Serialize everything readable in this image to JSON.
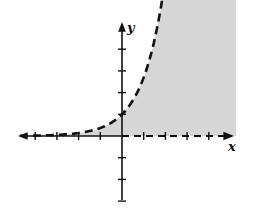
{
  "chart_data": {
    "type": "line",
    "title": "",
    "xlabel": "x",
    "ylabel": "y",
    "xlim": [
      -5,
      5
    ],
    "ylim": [
      -3,
      5.3
    ],
    "tick_spacing": 1,
    "x_ticks": [
      -4,
      -3,
      -2,
      -1,
      1,
      2,
      3,
      4
    ],
    "y_ticks": [
      -3,
      -2,
      -1,
      1,
      2,
      3,
      4
    ],
    "grid": false,
    "legend": null,
    "series": [
      {
        "name": "boundary curve",
        "style": "dashed",
        "x": [
          -5,
          -4,
          -3,
          -2,
          -1,
          0,
          0.5,
          1,
          1.5,
          1.95
        ],
        "y": [
          0.01,
          0.02,
          0.05,
          0.14,
          0.37,
          1,
          1.65,
          2.7,
          4.4,
          5.3
        ]
      },
      {
        "name": "boundary line y=0",
        "style": "dashed",
        "x": [
          0,
          5
        ],
        "y": [
          0,
          0
        ]
      }
    ],
    "shaded_region": {
      "description": "region below the dashed curve and above the dashed x-axis",
      "color": "#d6d6d6"
    }
  },
  "labels": {
    "x": "x",
    "y": "y"
  },
  "colors": {
    "ink": "#111111",
    "shade": "#d6d6d6"
  }
}
